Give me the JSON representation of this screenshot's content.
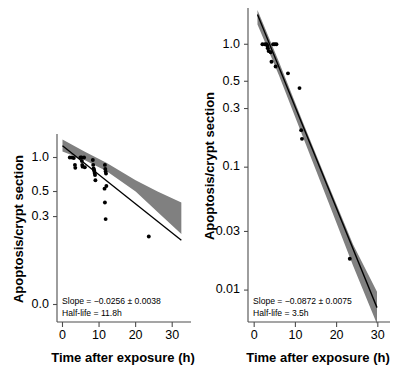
{
  "figure": {
    "background": "#ffffff",
    "band_color": "#808080",
    "line_color": "#000000",
    "point_color": "#000000",
    "axis_color": "#4d4d4d"
  },
  "chart_data": [
    {
      "type": "scatter",
      "panel": "left",
      "title": "",
      "xlabel": "Time after exposure (h)",
      "ylabel": "Apoptosis/crypt section",
      "xlim": [
        -1.5,
        33.5
      ],
      "ylim": [
        0.035,
        1.55
      ],
      "yscale": "log",
      "xscale": "linear",
      "grid": false,
      "legend": "none",
      "xticks": [
        0,
        10,
        20,
        30
      ],
      "xticklabels": [
        "0",
        "10",
        "20",
        "30"
      ],
      "yticks": [
        1.0,
        0.5,
        0.3,
        0.05
      ],
      "yticklabels": [
        "1.0",
        "0.5",
        "0.3",
        "0.0"
      ],
      "annotation_slope": "Slope = −0.0256 ± 0.0038",
      "annotation_halflife": "Half-life = 11.8h",
      "slope": -0.0256,
      "slope_error": 0.0038,
      "half_life_h": 11.8,
      "half_life_label": "11.8h",
      "fit": {
        "x": [
          0,
          32.5
        ],
        "y": [
          1.27,
          0.185
        ]
      },
      "ci_upper": {
        "x": [
          0,
          6,
          12,
          20,
          26,
          32.5
        ],
        "y": [
          1.44,
          1.13,
          0.9,
          0.63,
          0.5,
          0.4
        ]
      },
      "ci_lower": {
        "x": [
          0,
          6,
          12,
          20,
          26,
          32.5
        ],
        "y": [
          1.13,
          0.95,
          0.76,
          0.5,
          0.33,
          0.21
        ]
      },
      "points": [
        {
          "x": 2.0,
          "y": 1.0
        },
        {
          "x": 2.6,
          "y": 1.0
        },
        {
          "x": 3.1,
          "y": 0.99
        },
        {
          "x": 3.4,
          "y": 0.86
        },
        {
          "x": 3.5,
          "y": 0.81
        },
        {
          "x": 4.9,
          "y": 1.0
        },
        {
          "x": 5.2,
          "y": 1.0
        },
        {
          "x": 5.3,
          "y": 0.93
        },
        {
          "x": 5.4,
          "y": 0.86
        },
        {
          "x": 5.5,
          "y": 0.83
        },
        {
          "x": 5.9,
          "y": 1.0
        },
        {
          "x": 6.1,
          "y": 0.82
        },
        {
          "x": 8.3,
          "y": 0.95
        },
        {
          "x": 8.4,
          "y": 0.86
        },
        {
          "x": 8.5,
          "y": 0.8
        },
        {
          "x": 8.6,
          "y": 0.78
        },
        {
          "x": 8.7,
          "y": 0.76
        },
        {
          "x": 8.8,
          "y": 0.73
        },
        {
          "x": 8.9,
          "y": 0.7
        },
        {
          "x": 9.0,
          "y": 0.63
        },
        {
          "x": 11.6,
          "y": 0.86
        },
        {
          "x": 11.7,
          "y": 0.79
        },
        {
          "x": 11.8,
          "y": 0.75
        },
        {
          "x": 11.9,
          "y": 0.72
        },
        {
          "x": 12.0,
          "y": 0.56
        },
        {
          "x": 11.5,
          "y": 0.53
        },
        {
          "x": 11.6,
          "y": 0.4
        },
        {
          "x": 11.8,
          "y": 0.285
        },
        {
          "x": 23.6,
          "y": 0.2
        }
      ]
    },
    {
      "type": "scatter",
      "panel": "right",
      "title": "",
      "xlabel": "Time after exposure (h)",
      "ylabel": "Apoptosis/crypt section",
      "xlim": [
        -1.5,
        31.5
      ],
      "ylim": [
        0.0055,
        1.9
      ],
      "yscale": "log",
      "xscale": "linear",
      "grid": false,
      "legend": "none",
      "xticks": [
        0,
        10,
        20,
        30
      ],
      "xticklabels": [
        "0",
        "10",
        "20",
        "30"
      ],
      "yticks": [
        1.0,
        0.5,
        0.3,
        0.1,
        0.03,
        0.01
      ],
      "yticklabels": [
        "1.0",
        "0.5",
        "0.3",
        "0.1",
        "0.03",
        "0.01"
      ],
      "annotation_slope": "Slope = −0.0872 ± 0.0075",
      "annotation_halflife": "Half-life = 3.5h",
      "slope": -0.0872,
      "slope_error": 0.0075,
      "half_life_h": 3.5,
      "half_life_label": "3.5h",
      "fit": {
        "x": [
          0.8,
          29.8
        ],
        "y": [
          1.75,
          0.0072
        ]
      },
      "ci_upper": {
        "x": [
          0.8,
          6,
          12,
          18,
          24,
          29.8
        ],
        "y": [
          1.9,
          0.72,
          0.225,
          0.072,
          0.0235,
          0.0097
        ]
      },
      "ci_lower": {
        "x": [
          0.8,
          6,
          12,
          18,
          24,
          29.8
        ],
        "y": [
          1.45,
          0.56,
          0.17,
          0.052,
          0.0158,
          0.0053
        ]
      },
      "points": [
        {
          "x": 2.0,
          "y": 1.0
        },
        {
          "x": 2.6,
          "y": 1.0
        },
        {
          "x": 3.0,
          "y": 1.0
        },
        {
          "x": 3.2,
          "y": 0.97
        },
        {
          "x": 3.3,
          "y": 0.93
        },
        {
          "x": 3.5,
          "y": 0.88
        },
        {
          "x": 4.0,
          "y": 0.86
        },
        {
          "x": 4.6,
          "y": 1.0
        },
        {
          "x": 5.0,
          "y": 1.0
        },
        {
          "x": 5.4,
          "y": 1.0
        },
        {
          "x": 4.2,
          "y": 0.72
        },
        {
          "x": 5.2,
          "y": 0.66
        },
        {
          "x": 8.2,
          "y": 0.58
        },
        {
          "x": 11.0,
          "y": 0.44
        },
        {
          "x": 11.4,
          "y": 0.2
        },
        {
          "x": 11.6,
          "y": 0.17
        },
        {
          "x": 23.2,
          "y": 0.018
        }
      ]
    }
  ]
}
